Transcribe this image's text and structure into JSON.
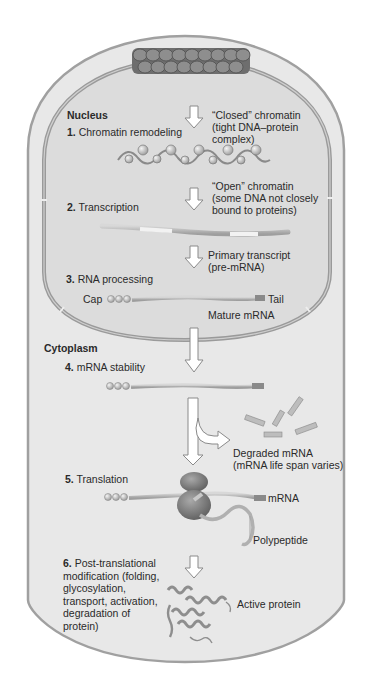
{
  "diagram": {
    "type": "gene-expression-regulation",
    "compartments": {
      "nucleus": "Nucleus",
      "cytoplasm": "Cytoplasm"
    },
    "steps": [
      {
        "num": "1.",
        "label": "Chromatin remodeling"
      },
      {
        "num": "2.",
        "label": "Transcription"
      },
      {
        "num": "3.",
        "label": "RNA processing"
      },
      {
        "num": "4.",
        "label": "mRNA stability"
      },
      {
        "num": "5.",
        "label": "Translation"
      },
      {
        "num": "6.",
        "label_lines": [
          "Post-translational",
          "modification (folding,",
          "glycosylation,",
          "transport, activation,",
          "degradation of",
          "protein)"
        ]
      }
    ],
    "annotations": {
      "closed_chromatin": [
        "“Closed” chromatin",
        "(tight DNA–protein",
        "complex)"
      ],
      "open_chromatin": [
        "“Open” chromatin",
        "(some DNA not closely",
        "bound to proteins)"
      ],
      "primary_transcript": [
        "Primary transcript",
        "(pre-mRNA)"
      ],
      "cap": "Cap",
      "tail": "Tail",
      "mature_mrna": "Mature mRNA",
      "degraded_mrna": [
        "Degraded mRNA",
        "(mRNA life span varies)"
      ],
      "mrna": "mRNA",
      "polypeptide": "Polypeptide",
      "active_protein": "Active protein"
    },
    "colors": {
      "cell_fill": "#e6e6e6",
      "nucleus_fill": "#dadada",
      "membrane": "#9a9a9a",
      "arrow_fill": "#ffffff",
      "arrow_stroke": "#8a8a8a",
      "mrna": "#b8b8b8",
      "ribosome": "#7c7c7c",
      "text": "#2a2a2a"
    }
  }
}
